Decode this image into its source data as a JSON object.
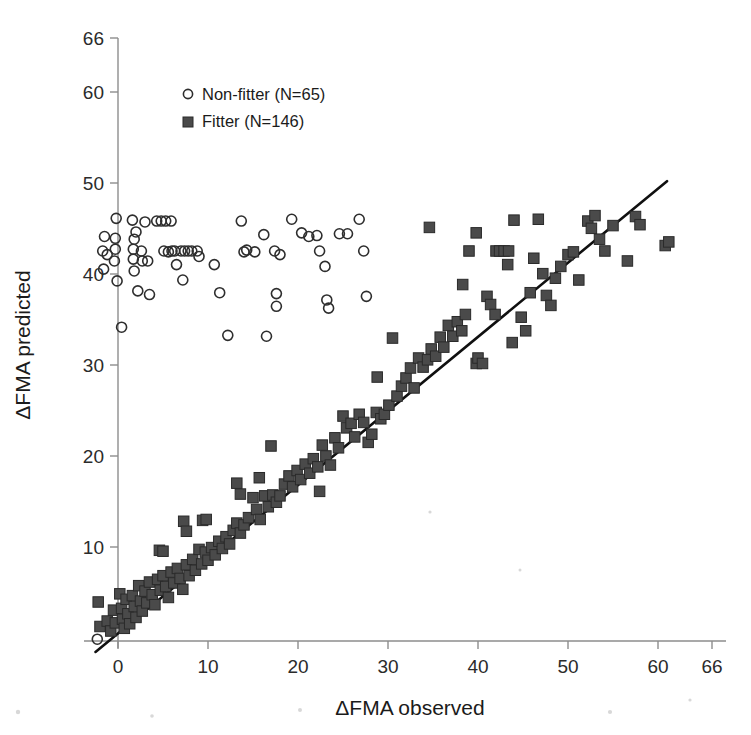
{
  "figure": {
    "background_color": "#ffffff",
    "marker_open_color": "#2e2e2e",
    "marker_filled_color": "#4a4a4a",
    "line_color": "#101010",
    "axis_color": "#8d8d8d"
  },
  "axes": {
    "x_label": "ΔFMA observed",
    "y_label": "ΔFMA predicted",
    "x_ticks": [
      "0",
      "10",
      "20",
      "30",
      "40",
      "50",
      "60",
      "66"
    ],
    "y_ticks": [
      "10",
      "20",
      "30",
      "40",
      "50",
      "60",
      "66"
    ]
  },
  "legend": {
    "items": [
      {
        "marker": "open-circle",
        "label": "Non-fitter  (N=65)"
      },
      {
        "marker": "filled-square",
        "label": "Fitter (N=146)"
      }
    ]
  },
  "chart_data": {
    "type": "scatter",
    "title": "",
    "xlabel": "ΔFMA observed",
    "ylabel": "ΔFMA predicted",
    "xlim": [
      -3,
      66
    ],
    "ylim": [
      -2,
      66
    ],
    "xticks": [
      0,
      10,
      20,
      30,
      40,
      50,
      60,
      66
    ],
    "yticks": [
      10,
      20,
      30,
      40,
      50,
      60,
      66
    ],
    "grid": false,
    "legend_position": "upper-left-inside",
    "reference_line": {
      "label": "identity / regression line",
      "x": [
        -2.5,
        61
      ],
      "y": [
        -1.2,
        50.7
      ],
      "color": "#101010"
    },
    "series": [
      {
        "name": "Non-fitter  (N=65)",
        "n": 65,
        "marker": "open-circle",
        "color": "#2e2e2e",
        "points": [
          [
            -2.3,
            0.2
          ],
          [
            -1.6,
            41.0
          ],
          [
            -1.7,
            43.0
          ],
          [
            -1.5,
            44.6
          ],
          [
            -0.2,
            46.6
          ],
          [
            -0.3,
            44.4
          ],
          [
            -0.3,
            43.2
          ],
          [
            -0.4,
            41.9
          ],
          [
            -1.2,
            42.6
          ],
          [
            -0.1,
            39.7
          ],
          [
            0.4,
            34.6
          ],
          [
            1.6,
            46.4
          ],
          [
            1.8,
            44.3
          ],
          [
            1.7,
            43.2
          ],
          [
            1.7,
            42.1
          ],
          [
            1.8,
            40.8
          ],
          [
            2.6,
            43.0
          ],
          [
            2.7,
            41.9
          ],
          [
            2.2,
            38.6
          ],
          [
            3.0,
            46.2
          ],
          [
            3.3,
            41.9
          ],
          [
            3.5,
            38.2
          ],
          [
            4.3,
            46.3
          ],
          [
            4.8,
            46.3
          ],
          [
            5.3,
            46.3
          ],
          [
            5.9,
            46.3
          ],
          [
            5.1,
            43.0
          ],
          [
            5.6,
            42.9
          ],
          [
            6.0,
            43.0
          ],
          [
            6.3,
            43.0
          ],
          [
            6.5,
            41.5
          ],
          [
            7.0,
            43.0
          ],
          [
            7.4,
            43.0
          ],
          [
            7.8,
            43.0
          ],
          [
            8.2,
            43.0
          ],
          [
            8.8,
            43.0
          ],
          [
            7.2,
            39.8
          ],
          [
            9.0,
            42.4
          ],
          [
            11.3,
            38.4
          ],
          [
            13.7,
            46.3
          ],
          [
            14.0,
            42.9
          ],
          [
            14.3,
            43.1
          ],
          [
            15.2,
            42.9
          ],
          [
            16.2,
            44.8
          ],
          [
            17.4,
            43.0
          ],
          [
            17.6,
            38.3
          ],
          [
            17.6,
            36.9
          ],
          [
            18.0,
            42.6
          ],
          [
            19.3,
            46.5
          ],
          [
            21.2,
            44.6
          ],
          [
            22.1,
            44.7
          ],
          [
            22.4,
            43.0
          ],
          [
            23.0,
            41.3
          ],
          [
            23.2,
            37.6
          ],
          [
            23.4,
            36.7
          ],
          [
            24.6,
            44.9
          ],
          [
            25.5,
            44.9
          ],
          [
            26.8,
            46.5
          ],
          [
            27.3,
            43.0
          ],
          [
            27.6,
            38.0
          ],
          [
            12.2,
            33.7
          ],
          [
            16.5,
            33.6
          ],
          [
            20.4,
            45.0
          ],
          [
            10.7,
            41.5
          ],
          [
            2.0,
            45.1
          ]
        ]
      },
      {
        "name": "Fitter (N=146)",
        "n": 146,
        "marker": "filled-square",
        "color": "#4a4a4a",
        "points": [
          [
            -2.2,
            4.3
          ],
          [
            -2.0,
            1.6
          ],
          [
            -1.2,
            2.2
          ],
          [
            -0.8,
            1.1
          ],
          [
            -0.5,
            3.4
          ],
          [
            -0.3,
            2.0
          ],
          [
            0.2,
            5.2
          ],
          [
            0.4,
            3.6
          ],
          [
            0.5,
            2.4
          ],
          [
            0.7,
            1.4
          ],
          [
            0.9,
            4.6
          ],
          [
            1.1,
            3.0
          ],
          [
            1.3,
            1.9
          ],
          [
            1.6,
            5.0
          ],
          [
            1.8,
            3.8
          ],
          [
            2.0,
            2.6
          ],
          [
            2.3,
            6.1
          ],
          [
            2.5,
            4.4
          ],
          [
            2.7,
            3.3
          ],
          [
            3.0,
            5.5
          ],
          [
            3.2,
            4.2
          ],
          [
            3.5,
            6.5
          ],
          [
            3.8,
            5.1
          ],
          [
            4.1,
            4.0
          ],
          [
            4.4,
            6.8
          ],
          [
            4.7,
            5.6
          ],
          [
            5.0,
            7.2
          ],
          [
            5.3,
            6.0
          ],
          [
            5.6,
            4.8
          ],
          [
            5.9,
            7.6
          ],
          [
            6.2,
            6.4
          ],
          [
            6.6,
            8.0
          ],
          [
            6.9,
            6.9
          ],
          [
            7.2,
            5.7
          ],
          [
            7.6,
            8.4
          ],
          [
            7.9,
            7.2
          ],
          [
            8.3,
            9.0
          ],
          [
            8.6,
            7.8
          ],
          [
            9.0,
            10.1
          ],
          [
            9.3,
            8.5
          ],
          [
            9.7,
            9.8
          ],
          [
            10.0,
            8.9
          ],
          [
            10.4,
            10.3
          ],
          [
            10.8,
            9.5
          ],
          [
            11.2,
            11.0
          ],
          [
            11.6,
            10.2
          ],
          [
            12.0,
            11.5
          ],
          [
            12.4,
            10.7
          ],
          [
            4.6,
            10.0
          ],
          [
            5.0,
            9.9
          ],
          [
            7.3,
            13.2
          ],
          [
            7.6,
            12.1
          ],
          [
            9.4,
            13.3
          ],
          [
            9.8,
            13.4
          ],
          [
            12.8,
            12.2
          ],
          [
            13.2,
            13.0
          ],
          [
            13.6,
            11.9
          ],
          [
            14.0,
            12.8
          ],
          [
            14.5,
            13.6
          ],
          [
            15.0,
            15.8
          ],
          [
            15.4,
            14.5
          ],
          [
            15.8,
            13.4
          ],
          [
            16.3,
            16.0
          ],
          [
            16.7,
            14.8
          ],
          [
            13.2,
            17.4
          ],
          [
            13.6,
            16.2
          ],
          [
            15.7,
            18.0
          ],
          [
            17.2,
            16.1
          ],
          [
            17.6,
            15.3
          ],
          [
            18.0,
            16.0
          ],
          [
            18.5,
            17.3
          ],
          [
            19.0,
            18.2
          ],
          [
            19.4,
            17.0
          ],
          [
            19.9,
            18.8
          ],
          [
            20.3,
            17.8
          ],
          [
            20.8,
            19.5
          ],
          [
            21.3,
            18.5
          ],
          [
            21.7,
            20.1
          ],
          [
            22.2,
            19.2
          ],
          [
            22.7,
            21.6
          ],
          [
            23.1,
            20.4
          ],
          [
            23.6,
            19.4
          ],
          [
            17.0,
            21.5
          ],
          [
            22.4,
            16.5
          ],
          [
            24.1,
            22.4
          ],
          [
            24.5,
            21.3
          ],
          [
            25.0,
            24.8
          ],
          [
            25.4,
            23.5
          ],
          [
            25.9,
            24.0
          ],
          [
            26.3,
            22.5
          ],
          [
            26.8,
            25.0
          ],
          [
            27.3,
            24.1
          ],
          [
            27.8,
            21.9
          ],
          [
            28.2,
            22.8
          ],
          [
            28.7,
            25.2
          ],
          [
            29.2,
            24.5
          ],
          [
            29.6,
            25.0
          ],
          [
            30.1,
            26.0
          ],
          [
            28.8,
            29.1
          ],
          [
            30.5,
            33.4
          ],
          [
            31.0,
            27.0
          ],
          [
            31.5,
            28.1
          ],
          [
            32.0,
            29.0
          ],
          [
            32.5,
            30.1
          ],
          [
            32.9,
            27.9
          ],
          [
            33.4,
            31.2
          ],
          [
            33.9,
            30.2
          ],
          [
            34.4,
            31.0
          ],
          [
            34.6,
            45.6
          ],
          [
            34.8,
            32.2
          ],
          [
            35.3,
            31.4
          ],
          [
            35.8,
            33.5
          ],
          [
            36.2,
            32.4
          ],
          [
            36.7,
            34.8
          ],
          [
            37.2,
            33.6
          ],
          [
            37.7,
            35.2
          ],
          [
            38.2,
            34.2
          ],
          [
            38.6,
            36.0
          ],
          [
            38.3,
            39.3
          ],
          [
            39.0,
            43.0
          ],
          [
            39.8,
            30.6
          ],
          [
            40.0,
            31.2
          ],
          [
            40.5,
            30.6
          ],
          [
            41.0,
            38.0
          ],
          [
            41.4,
            37.1
          ],
          [
            41.9,
            36.0
          ],
          [
            42.0,
            43.0
          ],
          [
            42.4,
            43.0
          ],
          [
            42.9,
            43.0
          ],
          [
            43.4,
            43.0
          ],
          [
            43.3,
            41.5
          ],
          [
            43.8,
            32.9
          ],
          [
            44.8,
            35.7
          ],
          [
            45.3,
            34.2
          ],
          [
            45.8,
            38.4
          ],
          [
            46.2,
            42.2
          ],
          [
            46.7,
            46.5
          ],
          [
            47.2,
            40.5
          ],
          [
            47.6,
            38.1
          ],
          [
            48.1,
            37.0
          ],
          [
            48.6,
            40.0
          ],
          [
            49.2,
            41.3
          ],
          [
            50.0,
            42.6
          ],
          [
            50.6,
            42.9
          ],
          [
            51.2,
            39.8
          ],
          [
            52.2,
            46.3
          ],
          [
            52.6,
            45.5
          ],
          [
            53.0,
            46.9
          ],
          [
            53.5,
            44.3
          ],
          [
            54.1,
            43.0
          ],
          [
            55.0,
            45.8
          ],
          [
            56.6,
            41.9
          ],
          [
            57.5,
            46.8
          ],
          [
            60.8,
            43.6
          ],
          [
            61.2,
            44.0
          ],
          [
            58.0,
            45.9
          ],
          [
            44.0,
            46.4
          ],
          [
            39.8,
            45.0
          ]
        ]
      }
    ]
  }
}
